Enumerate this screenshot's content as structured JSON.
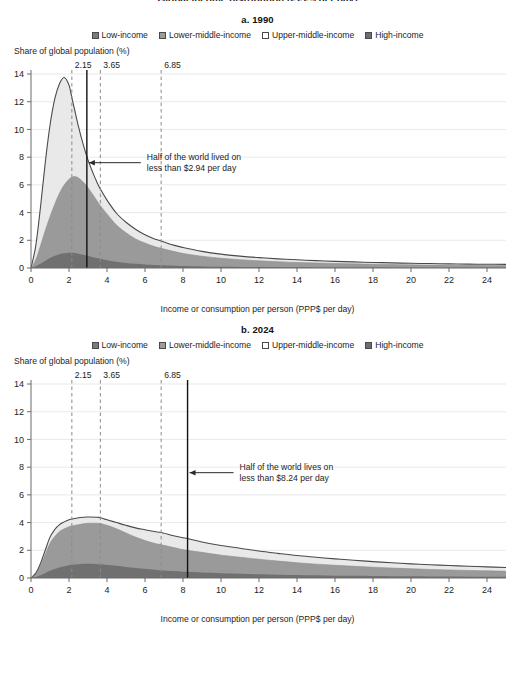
{
  "cut_off_header": "Global income distribution (PPP$ per day)",
  "legend": {
    "items": [
      {
        "label": "Low-income",
        "color": "#7b7b7b"
      },
      {
        "label": "Lower-middle-income",
        "color": "#9c9c9c"
      },
      {
        "label": "Upper-middle-income",
        "color": "#ffffff"
      },
      {
        "label": "High-income",
        "color": "#6e6e6e"
      }
    ]
  },
  "axis_titles": {
    "y": "Share of global population (%)",
    "x": "Income or consumption per person (PPP$ per day)"
  },
  "colors": {
    "low_income": "#707070",
    "lower_middle_income": "#9a9a9a",
    "upper_middle_income": "#e9e9e9",
    "high_income": "#6e6e6e",
    "outline": "#4a4a4a",
    "grid": "#e3e3e3",
    "axis": "#6b6b6b",
    "threshold_dash": "#8c8c8c",
    "median_line": "#111111",
    "text": "#1d1d1d"
  },
  "chart_data": {
    "type": "area",
    "title": "Global income distribution",
    "xlabel": "Income or consumption per person (PPP$ per day)",
    "ylabel": "Share of global population (%)",
    "xlim": [
      0,
      25
    ],
    "ylim": [
      0,
      14
    ],
    "xticks": [
      0,
      2,
      4,
      6,
      8,
      10,
      12,
      14,
      16,
      18,
      20,
      22,
      24
    ],
    "yticks": [
      0,
      2,
      4,
      6,
      8,
      10,
      12,
      14
    ],
    "grid": true,
    "legend_position": "top",
    "panels": [
      {
        "id": "a",
        "title": "a. 1990",
        "median": 2.94,
        "median_label_line1": "Half of the world lived on",
        "median_label_line2": "less than $2.94 per day",
        "thresholds": [
          {
            "value": 2.15,
            "label": "2.15"
          },
          {
            "value": 3.65,
            "label": "3.65"
          },
          {
            "value": 6.85,
            "label": "6.85"
          }
        ],
        "x": [
          0,
          0.25,
          0.5,
          0.75,
          1,
          1.25,
          1.5,
          1.75,
          2,
          2.15,
          2.3,
          2.5,
          2.75,
          3,
          3.25,
          3.5,
          3.65,
          4,
          4.5,
          5,
          5.5,
          6,
          6.5,
          6.85,
          7.5,
          8,
          9,
          10,
          11,
          12,
          13,
          14,
          15,
          16,
          17,
          18,
          19,
          20,
          21,
          22,
          23,
          24,
          25
        ],
        "series": [
          {
            "name": "Low-income",
            "values": [
              0,
              0.12,
              0.3,
              0.52,
              0.72,
              0.88,
              1.0,
              1.06,
              1.1,
              1.1,
              1.08,
              1.03,
              0.95,
              0.86,
              0.78,
              0.7,
              0.66,
              0.56,
              0.45,
              0.36,
              0.3,
              0.25,
              0.21,
              0.19,
              0.16,
              0.14,
              0.11,
              0.09,
              0.075,
              0.065,
              0.055,
              0.048,
              0.042,
              0.037,
              0.033,
              0.03,
              0.027,
              0.024,
              0.022,
              0.02,
              0.018,
              0.017,
              0.016
            ]
          },
          {
            "name": "Lower-middle-income",
            "values": [
              0,
              0.6,
              1.6,
              2.7,
              3.7,
              4.6,
              5.4,
              6.0,
              6.4,
              6.55,
              6.6,
              6.5,
              6.2,
              5.8,
              5.3,
              4.8,
              4.5,
              3.9,
              3.1,
              2.55,
              2.1,
              1.8,
              1.55,
              1.42,
              1.2,
              1.05,
              0.85,
              0.7,
              0.6,
              0.52,
              0.45,
              0.4,
              0.36,
              0.33,
              0.3,
              0.27,
              0.25,
              0.23,
              0.21,
              0.2,
              0.19,
              0.18,
              0.17
            ]
          },
          {
            "name": "Upper-middle-income",
            "values": [
              0,
              1.6,
              4.4,
              7.6,
              10.3,
              12.2,
              13.3,
              13.75,
              13.2,
              12.3,
              11.4,
              10.2,
              8.9,
              7.8,
              6.9,
              6.1,
              5.7,
              4.9,
              3.95,
              3.3,
              2.8,
              2.4,
              2.1,
              1.95,
              1.65,
              1.48,
              1.2,
              1.0,
              0.86,
              0.75,
              0.66,
              0.59,
              0.53,
              0.48,
              0.44,
              0.4,
              0.37,
              0.34,
              0.32,
              0.3,
              0.28,
              0.27,
              0.26
            ]
          }
        ]
      },
      {
        "id": "b",
        "title": "b. 2024",
        "median": 8.24,
        "median_label_line1": "Half of the world lives on",
        "median_label_line2": "less than $8.24 per day",
        "thresholds": [
          {
            "value": 2.15,
            "label": "2.15"
          },
          {
            "value": 3.65,
            "label": "3.65"
          },
          {
            "value": 6.85,
            "label": "6.85"
          }
        ],
        "x": [
          0,
          0.25,
          0.5,
          0.75,
          1,
          1.25,
          1.5,
          1.75,
          2,
          2.15,
          2.5,
          3,
          3.5,
          3.65,
          4,
          4.5,
          5,
          5.5,
          6,
          6.5,
          6.85,
          7.5,
          8,
          8.24,
          9,
          10,
          11,
          12,
          13,
          14,
          15,
          16,
          17,
          18,
          19,
          20,
          21,
          22,
          23,
          24,
          25
        ],
        "series": [
          {
            "name": "Low-income",
            "values": [
              0,
              0.08,
              0.2,
              0.36,
              0.52,
              0.65,
              0.76,
              0.85,
              0.92,
              0.95,
              1.0,
              1.02,
              1.0,
              0.99,
              0.95,
              0.88,
              0.8,
              0.73,
              0.66,
              0.6,
              0.56,
              0.5,
              0.46,
              0.45,
              0.4,
              0.35,
              0.3,
              0.27,
              0.24,
              0.21,
              0.19,
              0.17,
              0.155,
              0.14,
              0.13,
              0.12,
              0.11,
              0.1,
              0.095,
              0.09,
              0.085
            ]
          },
          {
            "name": "Lower-middle-income",
            "values": [
              0,
              0.3,
              0.9,
              1.7,
              2.5,
              3.0,
              3.35,
              3.55,
              3.7,
              3.75,
              3.85,
              3.95,
              3.95,
              3.93,
              3.8,
              3.55,
              3.25,
              2.95,
              2.7,
              2.5,
              2.4,
              2.2,
              2.05,
              2.0,
              1.85,
              1.65,
              1.5,
              1.35,
              1.22,
              1.1,
              1.0,
              0.92,
              0.85,
              0.78,
              0.72,
              0.67,
              0.62,
              0.58,
              0.55,
              0.52,
              0.49
            ]
          },
          {
            "name": "Upper-middle-income",
            "values": [
              0,
              0.35,
              1.05,
              2.0,
              2.95,
              3.5,
              3.85,
              4.05,
              4.2,
              4.25,
              4.35,
              4.4,
              4.38,
              4.35,
              4.2,
              4.0,
              3.8,
              3.62,
              3.48,
              3.35,
              3.28,
              3.05,
              2.9,
              2.85,
              2.6,
              2.35,
              2.15,
              1.95,
              1.78,
              1.62,
              1.5,
              1.38,
              1.28,
              1.18,
              1.1,
              1.02,
              0.96,
              0.9,
              0.85,
              0.8,
              0.76
            ]
          }
        ]
      }
    ]
  }
}
